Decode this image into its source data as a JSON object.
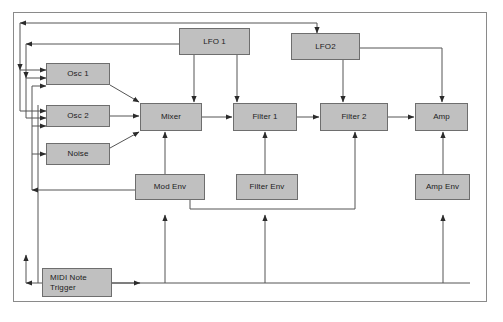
{
  "diagram": {
    "border_color": "#8a8a8a",
    "node_fill": "#c0c0c0",
    "node_stroke": "#6e6e6e",
    "wire_color": "#555555",
    "background": "#ffffff"
  },
  "nodes": {
    "lfo1": {
      "label": "LFO 1",
      "x": 179,
      "y": 28,
      "w": 71,
      "h": 27
    },
    "lfo2": {
      "label": "LFO2",
      "x": 291,
      "y": 33,
      "w": 69,
      "h": 27
    },
    "osc1": {
      "label": "Osc 1",
      "x": 46,
      "y": 63,
      "w": 64,
      "h": 22
    },
    "osc2": {
      "label": "Osc 2",
      "x": 46,
      "y": 105,
      "w": 64,
      "h": 22
    },
    "noise": {
      "label": "Noise",
      "x": 46,
      "y": 143,
      "w": 64,
      "h": 22
    },
    "mixer": {
      "label": "Mixer",
      "x": 140,
      "y": 103,
      "w": 62,
      "h": 28
    },
    "filter1": {
      "label": "Filter 1",
      "x": 233,
      "y": 103,
      "w": 64,
      "h": 28
    },
    "filter2": {
      "label": "Filter 2",
      "x": 320,
      "y": 103,
      "w": 68,
      "h": 28
    },
    "amp": {
      "label": "Amp",
      "x": 415,
      "y": 103,
      "w": 53,
      "h": 28
    },
    "mod_env": {
      "label": "Mod Env",
      "x": 135,
      "y": 174,
      "w": 70,
      "h": 26
    },
    "filter_env": {
      "label": "Filter Env",
      "x": 236,
      "y": 174,
      "w": 62,
      "h": 26
    },
    "amp_env": {
      "label": "Amp Env",
      "x": 415,
      "y": 174,
      "w": 55,
      "h": 26
    },
    "midi": {
      "label": "MIDI Note\nTrigger",
      "x": 42,
      "y": 268,
      "w": 70,
      "h": 29
    }
  }
}
